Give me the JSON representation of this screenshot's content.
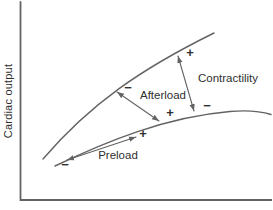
{
  "figure": {
    "y_axis_label": "Cardiac output",
    "arrows": {
      "preload": {
        "label": "Preload",
        "plus": "+",
        "minus": "−"
      },
      "afterload": {
        "label": "Afterload",
        "plus": "+",
        "minus": "−"
      },
      "contractility": {
        "label": "Contractility",
        "plus": "+",
        "minus": "−"
      }
    },
    "colors": {
      "line": "#636363",
      "text": "#2f2f2f",
      "background": "#ffffff"
    }
  }
}
